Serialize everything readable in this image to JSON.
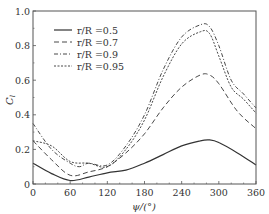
{
  "chart_data": {
    "type": "line",
    "title": "",
    "xlabel": "ψ/(°)",
    "ylabel": "C_l",
    "xlim": [
      0,
      360
    ],
    "ylim": [
      0,
      1.0
    ],
    "xticks": [
      0,
      60,
      120,
      180,
      240,
      300,
      360
    ],
    "yticks": [
      0,
      0.2,
      0.4,
      0.6,
      0.8,
      1.0
    ],
    "xtick_labels": [
      "0",
      "60",
      "120",
      "180",
      "240",
      "300",
      "360"
    ],
    "ytick_labels": [
      "0",
      "0.2",
      "0.4",
      "0.6",
      "0.8",
      "1.0"
    ],
    "grid": false,
    "legend_position": "upper left",
    "series": [
      {
        "name": "r/R =0.5",
        "style": "solid",
        "x": [
          0,
          30,
          60,
          90,
          120,
          150,
          180,
          210,
          240,
          270,
          285,
          300,
          330,
          360
        ],
        "values": [
          0.12,
          0.06,
          0.02,
          0.04,
          0.065,
          0.08,
          0.12,
          0.17,
          0.22,
          0.25,
          0.255,
          0.24,
          0.18,
          0.11
        ]
      },
      {
        "name": "r/R =0.7",
        "style": "dashed",
        "x": [
          0,
          30,
          60,
          90,
          120,
          150,
          180,
          210,
          240,
          270,
          285,
          300,
          330,
          360
        ],
        "values": [
          0.25,
          0.14,
          0.05,
          0.07,
          0.1,
          0.18,
          0.29,
          0.44,
          0.56,
          0.63,
          0.63,
          0.58,
          0.42,
          0.32
        ]
      },
      {
        "name": "r/R =0.9",
        "style": "dashdot",
        "x": [
          0,
          30,
          60,
          75,
          90,
          120,
          150,
          180,
          210,
          240,
          270,
          285,
          300,
          320,
          340,
          360
        ],
        "values": [
          0.35,
          0.2,
          0.12,
          0.1,
          0.12,
          0.11,
          0.22,
          0.4,
          0.66,
          0.85,
          0.92,
          0.91,
          0.8,
          0.6,
          0.52,
          0.44
        ]
      },
      {
        "name": "r/R =0.95",
        "style": "dotted",
        "x": [
          0,
          30,
          60,
          90,
          120,
          150,
          180,
          210,
          240,
          270,
          285,
          300,
          320,
          340,
          360
        ],
        "values": [
          0.25,
          0.22,
          0.13,
          0.12,
          0.1,
          0.2,
          0.37,
          0.62,
          0.81,
          0.88,
          0.87,
          0.74,
          0.56,
          0.49,
          0.41
        ]
      }
    ]
  },
  "colors": {
    "line": "#333333",
    "axis": "#444444"
  }
}
